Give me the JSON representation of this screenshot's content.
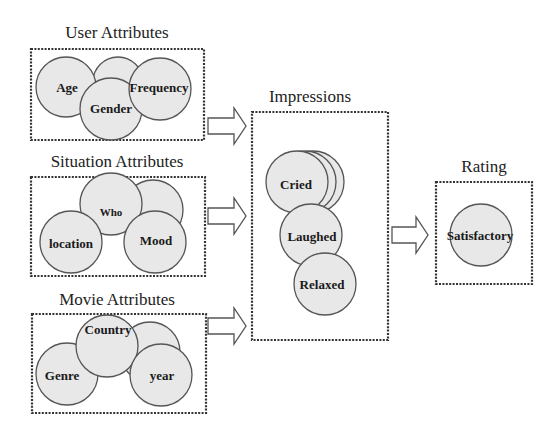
{
  "diagram": {
    "groups": {
      "user": {
        "title": "User Attributes",
        "items": [
          "Age",
          "Gender",
          "Frequency"
        ]
      },
      "situation": {
        "title": "Situation Attributes",
        "items": [
          "Who",
          "location",
          "Mood"
        ]
      },
      "movie": {
        "title": "Movie Attributes",
        "items": [
          "Country",
          "Genre",
          "year"
        ]
      },
      "impressions": {
        "title": "Impressions",
        "items": [
          "Cried",
          "Laughed",
          "Relaxed"
        ]
      },
      "rating": {
        "title": "Rating",
        "items": [
          "Satisfactory"
        ]
      }
    },
    "colors": {
      "circle_fill": "#e8e8e8",
      "circle_stroke": "#555555",
      "box_stroke": "#333333",
      "background": "#ffffff"
    }
  }
}
